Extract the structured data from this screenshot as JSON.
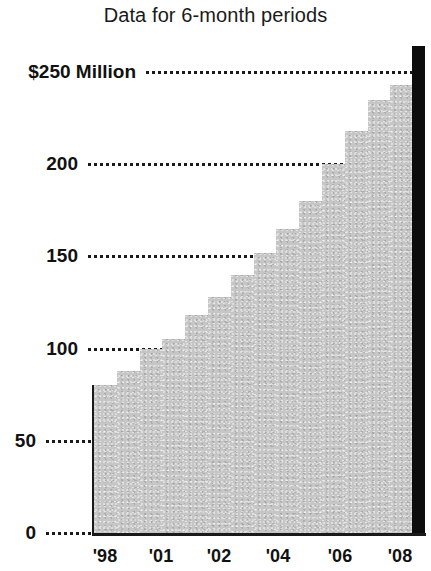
{
  "chart_data": {
    "type": "bar",
    "title": "Data for 6-month periods",
    "xlabel": "",
    "ylabel": "$250 Million",
    "ylim": [
      0,
      250
    ],
    "xlim": [
      0,
      14
    ],
    "grid": true,
    "legend": "none",
    "y_ticks": [
      {
        "value": 250,
        "label": "$250 Million"
      },
      {
        "value": 200,
        "label": "200"
      },
      {
        "value": 150,
        "label": "150"
      },
      {
        "value": 100,
        "label": "100"
      },
      {
        "value": 50,
        "label": "50"
      },
      {
        "value": 0,
        "label": "0"
      }
    ],
    "x_ticks": [
      {
        "label": "'98"
      },
      {
        "label": "'01"
      },
      {
        "label": "'02"
      },
      {
        "label": "'04"
      },
      {
        "label": "'06"
      },
      {
        "label": "'08"
      }
    ],
    "categories": [
      "'98 H1",
      "'98 H2",
      "'01 H1",
      "'01 H2",
      "'02 H1",
      "'02 H2",
      "'03 H1",
      "'03 H2",
      "'04 H1",
      "'05 H1",
      "'06 H1",
      "'06 H2",
      "'07 H1",
      "'08 H1"
    ],
    "values": [
      80,
      88,
      100,
      105,
      118,
      128,
      140,
      152,
      165,
      180,
      200,
      218,
      235,
      243
    ],
    "final_marker_value": 250,
    "colors": {
      "step_fill": "#c6c6c6",
      "end_bar": "#0d0d0d",
      "axis": "#1a1a1a",
      "gridline": "#1a1a1a",
      "text": "#111111",
      "background": "#ffffff"
    }
  },
  "geometry": {
    "baseline_y": 533,
    "top_value_y": 72,
    "plot_left_x": 94,
    "plot_right_x": 413,
    "step_width": 22.8,
    "end_bar_left_x": 412,
    "end_bar_width": 13,
    "end_bar_top_y": 46
  }
}
